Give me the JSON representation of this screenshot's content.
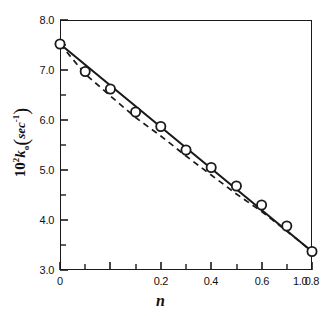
{
  "figure": {
    "background": "#ffffff",
    "ink": "#1a1a1a"
  },
  "axis": {
    "y_label_html": "10² k₀ (sec⁻¹)",
    "y_label_prefix": "10",
    "y_label_exp": "2",
    "y_label_symbol": "k",
    "y_label_sub": "o",
    "y_label_unit": "sec",
    "y_label_unit_exp": "-1",
    "x_label": "n",
    "y_ticks": [
      "3.0",
      "4.0",
      "5.0",
      "6.0",
      "7.0",
      "8.0"
    ],
    "y_tick_values": [
      3.0,
      4.0,
      5.0,
      6.0,
      7.0,
      8.0
    ],
    "y_minor_values": [
      3.5,
      4.5,
      5.5,
      6.5,
      7.5
    ],
    "x_ticks": [
      "0",
      "0.2",
      "0.4",
      "0.6",
      "0.8",
      "1.0"
    ],
    "x_tick_values": [
      0,
      0.2,
      0.4,
      0.6,
      0.8,
      1.0
    ],
    "x_minor_values": [
      0.1,
      0.3,
      0.5,
      0.7,
      0.9
    ]
  },
  "chart_data": {
    "type": "scatter",
    "title": "",
    "xlabel": "n",
    "ylabel": "10^2 k_o (sec^-1)",
    "xlim": [
      0,
      1.0
    ],
    "ylim": [
      3.0,
      8.0
    ],
    "grid": false,
    "legend": "none",
    "marker": "open-circle",
    "x": [
      0.0,
      0.1,
      0.2,
      0.3,
      0.4,
      0.5,
      0.6,
      0.7,
      0.8,
      0.9,
      1.0
    ],
    "values": [
      7.52,
      6.97,
      6.62,
      6.16,
      5.87,
      5.4,
      5.05,
      4.68,
      4.3,
      3.88,
      3.37
    ],
    "series": [
      {
        "name": "data points",
        "style": "open-circle-markers",
        "x": [
          0.0,
          0.1,
          0.2,
          0.3,
          0.4,
          0.5,
          0.6,
          0.7,
          0.8,
          0.9,
          1.0
        ],
        "values": [
          7.52,
          6.97,
          6.62,
          6.16,
          5.87,
          5.4,
          5.05,
          4.68,
          4.3,
          3.88,
          3.37
        ]
      },
      {
        "name": "solid fit line",
        "style": "solid",
        "x": [
          0.0,
          1.0
        ],
        "values": [
          7.52,
          3.37
        ]
      },
      {
        "name": "dashed curve",
        "style": "dashed",
        "x": [
          0.0,
          0.1,
          0.2,
          0.3,
          0.4,
          0.5,
          0.6,
          0.7,
          0.8,
          0.9,
          1.0
        ],
        "values": [
          7.52,
          6.92,
          6.48,
          6.05,
          5.68,
          5.28,
          4.9,
          4.52,
          4.17,
          3.78,
          3.37
        ]
      }
    ]
  }
}
